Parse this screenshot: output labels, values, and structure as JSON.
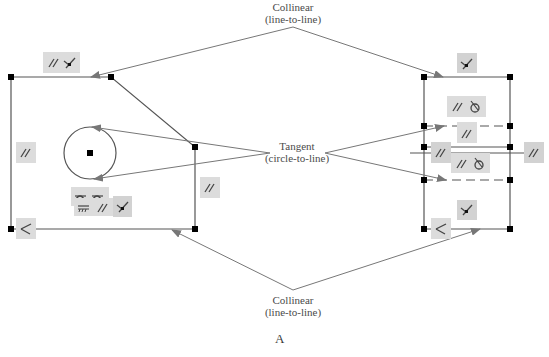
{
  "labels": {
    "collinear_top": {
      "line1": "Collinear",
      "line2": "(line-to-line)"
    },
    "tangent": {
      "line1": "Tangent",
      "line2": "(circle-to-line)"
    },
    "collinear_bottom": {
      "line1": "Collinear",
      "line2": "(line-to-line)"
    },
    "figure": "A"
  },
  "colors": {
    "line": "#555555",
    "arrow": "#777777",
    "badge_bg": "#dcdcdc",
    "point": "#000000"
  },
  "left_sketch": {
    "relation_badges": [
      {
        "id": "top",
        "icons": [
          "parallel-icon",
          "coincident-icon"
        ]
      },
      {
        "id": "left",
        "icons": [
          "parallel-icon"
        ]
      },
      {
        "id": "right",
        "icons": [
          "parallel-icon"
        ]
      },
      {
        "id": "circle-row1",
        "icons": [
          "tangent-icon",
          "tangent-icon"
        ]
      },
      {
        "id": "circle-row2",
        "icons": [
          "horizontal-icon",
          "parallel-icon",
          "coincident-icon"
        ]
      },
      {
        "id": "bottom-left",
        "icons": [
          "perpendicular-icon"
        ]
      }
    ]
  },
  "right_sketch": {
    "relation_badges": [
      {
        "id": "top",
        "icons": [
          "coincident-icon"
        ]
      },
      {
        "id": "upper",
        "icons": [
          "parallel-icon",
          "tangent-circle-icon"
        ]
      },
      {
        "id": "dashed1",
        "icons": [
          "parallel-icon"
        ]
      },
      {
        "id": "mid-left",
        "icons": [
          "parallel-icon"
        ]
      },
      {
        "id": "mid",
        "icons": [
          "parallel-icon",
          "tangent-circle-icon"
        ]
      },
      {
        "id": "mid-right",
        "icons": [
          "parallel-icon"
        ]
      },
      {
        "id": "lower",
        "icons": [
          "coincident-icon"
        ]
      },
      {
        "id": "bottom-left",
        "icons": [
          "perpendicular-icon"
        ]
      }
    ]
  }
}
